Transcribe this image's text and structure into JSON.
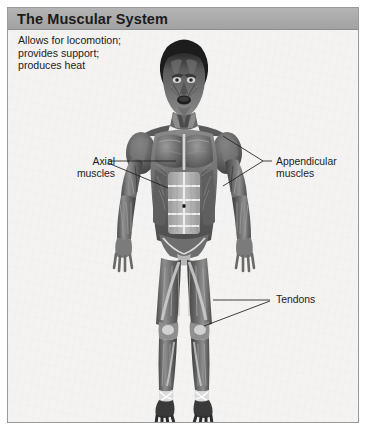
{
  "panel": {
    "title": "The Muscular System",
    "description": "Allows for locomotion;\nprovides support;\nproduces heat",
    "background_color": "#f4f3f1",
    "titlebar_color": "#a8a8a8",
    "border_color": "#9a9a9a"
  },
  "figure": {
    "name": "anterior-full-body-muscular-anatomy",
    "view": "anterior",
    "style": "grayscale-illustration"
  },
  "labels": [
    {
      "id": "axial",
      "text": "Axial\nmuscles",
      "side": "left"
    },
    {
      "id": "appendicular",
      "text": "Appendicular\nmuscles",
      "side": "right"
    },
    {
      "id": "tendons",
      "text": "Tendons",
      "side": "right"
    }
  ],
  "colors": {
    "leader_line": "#1f1f1f",
    "text": "#1c1c1c",
    "title_text": "#1b1b1b"
  }
}
